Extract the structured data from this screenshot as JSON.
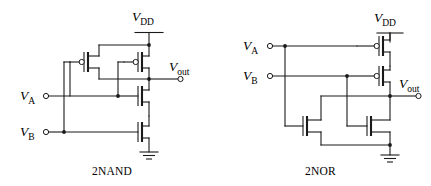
{
  "figure": {
    "background_color": "#ffffff",
    "line_color": "#1a1a1a",
    "width": 431,
    "height": 186
  },
  "circuits": [
    {
      "id": "nand",
      "caption": "2NAND",
      "supply_label": "V",
      "supply_sub": "DD",
      "output_label": "V",
      "output_sub": "out",
      "inputs": [
        {
          "label": "V",
          "sub": "A"
        },
        {
          "label": "V",
          "sub": "B"
        }
      ],
      "pmos_count": 2,
      "nmos_count": 2,
      "pmos_topology": "parallel",
      "nmos_topology": "series"
    },
    {
      "id": "nor",
      "caption": "2NOR",
      "supply_label": "V",
      "supply_sub": "DD",
      "output_label": "V",
      "output_sub": "out",
      "inputs": [
        {
          "label": "V",
          "sub": "A"
        },
        {
          "label": "V",
          "sub": "B"
        }
      ],
      "pmos_count": 2,
      "nmos_count": 2,
      "pmos_topology": "series",
      "nmos_topology": "parallel"
    }
  ],
  "symbols": {
    "ground": "ground-symbol",
    "supply_bar": "vdd-bar-symbol",
    "pmos": "pmos-transistor",
    "nmos": "nmos-transistor",
    "terminal": "open-circle-terminal",
    "junction": "junction-dot"
  }
}
